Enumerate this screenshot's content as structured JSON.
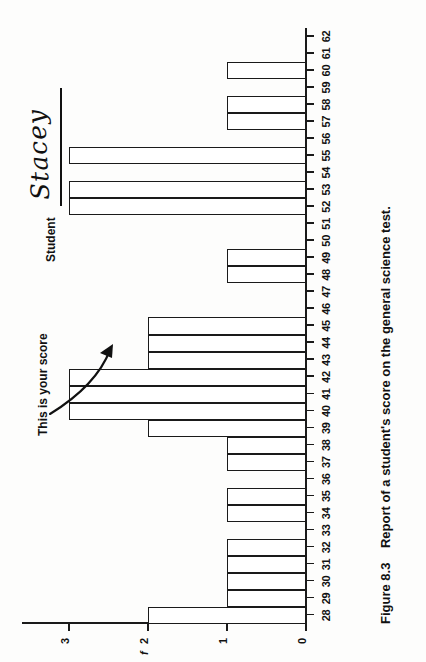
{
  "figure": {
    "caption_number": "Figure 8.3",
    "caption_text": "Report of a student's score on the general science test."
  },
  "annotations": {
    "score_note": "This is your score",
    "student_label": "Student",
    "student_name": "Stacey"
  },
  "axes": {
    "y_title": "f",
    "y_ticks": [
      "0",
      "1",
      "2",
      "3"
    ],
    "x_ticks": [
      "28",
      "29",
      "30",
      "31",
      "32",
      "33",
      "34",
      "35",
      "36",
      "37",
      "38",
      "39",
      "40",
      "41",
      "42",
      "43",
      "44",
      "45",
      "46",
      "47",
      "48",
      "49",
      "50",
      "51",
      "52",
      "53",
      "54",
      "55",
      "56",
      "57",
      "58",
      "59",
      "60",
      "61",
      "62"
    ]
  },
  "chart_data": {
    "type": "bar",
    "title": "Report of a student's score on the general science test.",
    "xlabel": "",
    "ylabel": "f",
    "ylim": [
      0,
      3.6
    ],
    "xlim": [
      27.5,
      62.5
    ],
    "grid": false,
    "legend": null,
    "orientation": "vertical-rotated-90",
    "categories": [
      28,
      29,
      30,
      31,
      32,
      33,
      34,
      35,
      36,
      37,
      38,
      39,
      40,
      41,
      42,
      43,
      44,
      45,
      46,
      47,
      48,
      49,
      50,
      51,
      52,
      53,
      54,
      55,
      56,
      57,
      58,
      59,
      60,
      61,
      62
    ],
    "values": [
      2,
      1,
      1,
      1,
      1,
      0,
      1,
      1,
      0,
      1,
      1,
      2,
      3,
      3,
      3,
      2,
      2,
      2,
      0,
      0,
      1,
      1,
      0,
      0,
      3,
      3,
      0,
      3,
      0,
      1,
      1,
      0,
      1,
      0,
      0
    ],
    "highlighted_category": 43,
    "annotations": [
      {
        "text": "This is your score",
        "points_to_category": 43
      },
      {
        "text": "Student Stacey",
        "points_to_category": null
      }
    ]
  }
}
